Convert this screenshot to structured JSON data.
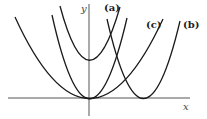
{
  "diagram": {
    "axes": {
      "x_label": "x",
      "y_label": "y"
    },
    "curves": [
      {
        "id": "base-wide",
        "label": "",
        "description": "y = k x^2, wide parabola through origin"
      },
      {
        "id": "base-narrow",
        "label": "",
        "description": "narrower parabola through origin"
      },
      {
        "id": "a",
        "label": "(a)",
        "description": "parabola shifted upward"
      },
      {
        "id": "b",
        "label": "(b)",
        "description": "parabola shifted right"
      },
      {
        "id": "c",
        "label": "(c)",
        "description": "wider parabola through origin"
      }
    ],
    "colors": {
      "stroke": "#1a1a1a",
      "axis": "#555555",
      "background": "#ffffff"
    }
  }
}
